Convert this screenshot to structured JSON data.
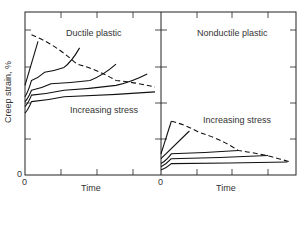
{
  "chart_data": [
    {
      "type": "line",
      "title": "Ductile plastic",
      "xlabel": "Time",
      "ylabel": "Creep strain, %",
      "x_origin_label": "0",
      "y_origin_label": "0",
      "annotation": "Increasing stress",
      "grid": false,
      "legend": "none",
      "series": [
        {
          "name": "highest stress",
          "style": "solid",
          "points": [
            [
              0,
              0.55
            ],
            [
              0.1,
              0.82
            ]
          ]
        },
        {
          "name": "stress 2",
          "style": "solid",
          "points": [
            [
              0,
              0.48
            ],
            [
              0.05,
              0.58
            ],
            [
              0.15,
              0.63
            ],
            [
              0.3,
              0.66
            ],
            [
              0.42,
              0.78
            ]
          ]
        },
        {
          "name": "stress 3",
          "style": "solid",
          "points": [
            [
              0,
              0.45
            ],
            [
              0.05,
              0.52
            ],
            [
              0.2,
              0.56
            ],
            [
              0.5,
              0.58
            ],
            [
              0.7,
              0.68
            ]
          ]
        },
        {
          "name": "stress 4",
          "style": "solid",
          "points": [
            [
              0,
              0.42
            ],
            [
              0.05,
              0.49
            ],
            [
              0.3,
              0.52
            ],
            [
              0.7,
              0.55
            ],
            [
              0.94,
              0.62
            ]
          ]
        },
        {
          "name": "lowest stress",
          "style": "solid",
          "points": [
            [
              0,
              0.38
            ],
            [
              0.05,
              0.45
            ],
            [
              0.3,
              0.48
            ],
            [
              1.0,
              0.51
            ]
          ]
        },
        {
          "name": "rupture envelope",
          "style": "dashed",
          "points": [
            [
              0.05,
              0.86
            ],
            [
              0.4,
              0.68
            ],
            [
              0.7,
              0.58
            ],
            [
              1.0,
              0.54
            ]
          ]
        }
      ]
    },
    {
      "type": "line",
      "title": "Nonductile plastic",
      "xlabel": "Time",
      "x_origin_label": "0",
      "annotation": "Increasing stress",
      "grid": false,
      "legend": "none",
      "series": [
        {
          "name": "highest stress",
          "style": "solid",
          "points": [
            [
              0,
              0.13
            ],
            [
              0.08,
              0.33
            ]
          ]
        },
        {
          "name": "stress 2",
          "style": "solid",
          "points": [
            [
              0,
              0.1
            ],
            [
              0.22,
              0.27
            ]
          ]
        },
        {
          "name": "stress 3",
          "style": "solid",
          "points": [
            [
              0,
              0.07
            ],
            [
              0.08,
              0.13
            ],
            [
              0.6,
              0.15
            ]
          ]
        },
        {
          "name": "stress 4",
          "style": "solid",
          "points": [
            [
              0,
              0.05
            ],
            [
              0.08,
              0.1
            ],
            [
              0.83,
              0.12
            ]
          ]
        },
        {
          "name": "lowest stress",
          "style": "solid",
          "points": [
            [
              0,
              0.03
            ],
            [
              0.08,
              0.07
            ],
            [
              0.98,
              0.08
            ]
          ]
        },
        {
          "name": "rupture envelope",
          "style": "dashed",
          "points": [
            [
              0.08,
              0.33
            ],
            [
              0.3,
              0.26
            ],
            [
              0.6,
              0.15
            ],
            [
              1.0,
              0.08
            ]
          ]
        }
      ]
    }
  ]
}
